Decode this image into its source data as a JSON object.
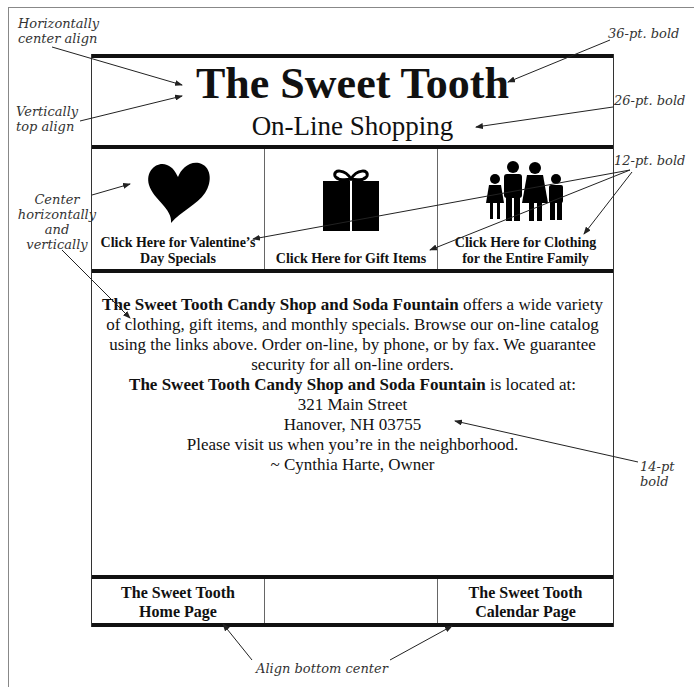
{
  "page": {
    "header_caption": "Illustration"
  },
  "banner": {
    "title": "The Sweet Tooth",
    "subtitle": "On-Line Shopping"
  },
  "nav": {
    "items": [
      {
        "label_line1": "Click Here for Valentine’s",
        "label_line2": "Day Specials",
        "icon": "heart-icon"
      },
      {
        "label_line1": "Click Here for Gift Items",
        "label_line2": "",
        "icon": "gift-icon"
      },
      {
        "label_line1": "Click Here for Clothing",
        "label_line2": "for the Entire Family",
        "icon": "family-icon"
      }
    ]
  },
  "body": {
    "p1_bold": "The Sweet Tooth Candy Shop and Soda Fountain",
    "p1_rest": " offers a wide variety of clothing, gift items, and monthly specials. Browse our on-line catalog using the links above. Order on-line, by phone, or by fax. We guarantee security for all on-line orders.",
    "p2_bold": "The Sweet Tooth Candy Shop and Soda Fountain",
    "p2_rest": " is located at:",
    "address_line1": "321 Main Street",
    "address_line2": "Hanover, NH 03755",
    "visit": "Please visit us when you’re in the neighborhood.",
    "signature": "~ Cynthia Harte, Owner"
  },
  "footer": {
    "home_line1": "The Sweet Tooth",
    "home_line2": "Home Page",
    "calendar_line1": "The Sweet Tooth",
    "calendar_line2": "Calendar Page"
  },
  "annotations": {
    "horiz_center": [
      "Horizontally",
      "center align"
    ],
    "vert_top": [
      "Vertically",
      "top align"
    ],
    "center_hv": [
      "Center",
      "horizontally",
      "and",
      "vertically"
    ],
    "pt36": "36-pt. bold",
    "pt26": "26-pt. bold",
    "pt12": "12-pt. bold",
    "pt14": "14-pt bold",
    "align_bottom": "Align bottom center"
  }
}
